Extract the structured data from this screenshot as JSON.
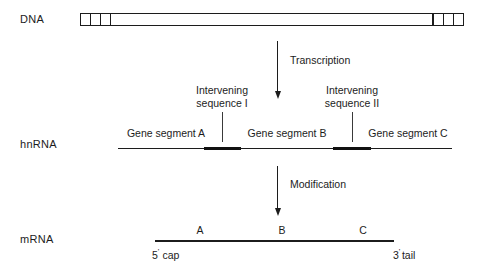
{
  "diagram": {
    "line_color": "#1c1c1c",
    "background": "#ffffff"
  },
  "rows": {
    "dna": {
      "label": "DNA",
      "left_boxes": 3,
      "right_boxes": 3
    },
    "hnrna": {
      "label": "hnRNA",
      "segments": [
        {
          "label": "Gene segment A"
        },
        {
          "label": "Gene segment B"
        },
        {
          "label": "Gene segment C"
        }
      ],
      "intervening": [
        {
          "line1": "Intervening",
          "line2": "sequence I"
        },
        {
          "line1": "Intervening",
          "line2": "sequence II"
        }
      ]
    },
    "mrna": {
      "label": "mRNA",
      "segments": [
        {
          "label": "A"
        },
        {
          "label": "B"
        },
        {
          "label": "C"
        }
      ],
      "five_prime": "5",
      "five_prime_word": "cap",
      "three_prime": "3",
      "three_prime_word": "tail",
      "prime_mark": "'"
    }
  },
  "arrows": [
    {
      "label": "Transcription"
    },
    {
      "label": "Modification"
    }
  ]
}
